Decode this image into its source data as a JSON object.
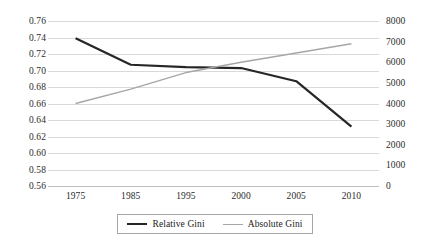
{
  "chart_data": {
    "type": "line",
    "title": "",
    "xlabel": "",
    "ylabel": "",
    "categories": [
      "1975",
      "1985",
      "1995",
      "2000",
      "2005",
      "2010"
    ],
    "grid": true,
    "legend_position": "bottom",
    "axes": {
      "left": {
        "label": "",
        "ylim": [
          0.56,
          0.76
        ],
        "tick_step": 0.02,
        "ticks": [
          "0.76",
          "0.74",
          "0.72",
          "0.70",
          "0.68",
          "0.66",
          "0.64",
          "0.62",
          "0.60",
          "0.58",
          "0.56"
        ],
        "tick_values": [
          0.76,
          0.74,
          0.72,
          0.7,
          0.68,
          0.66,
          0.64,
          0.62,
          0.6,
          0.58,
          0.56
        ]
      },
      "right": {
        "label": "",
        "ylim": [
          0,
          8000
        ],
        "tick_step": 1000,
        "ticks": [
          "8000",
          "7000",
          "6000",
          "5000",
          "4000",
          "3000",
          "2000",
          "1000",
          "0"
        ],
        "tick_values": [
          8000,
          7000,
          6000,
          5000,
          4000,
          3000,
          2000,
          1000,
          0
        ]
      }
    },
    "series": [
      {
        "name": "Relative Gini",
        "axis": "left",
        "color": "#262626",
        "width": 2.2,
        "values": [
          0.739,
          0.707,
          0.704,
          0.703,
          0.687,
          0.632
        ]
      },
      {
        "name": "Absolute Gini",
        "axis": "right",
        "color": "#a6a6a6",
        "width": 1.4,
        "values": [
          4000,
          4700,
          5500,
          6000,
          6450,
          6900
        ]
      }
    ]
  },
  "legend": {
    "entries": [
      {
        "label": "Relative Gini",
        "color": "#262626",
        "width": 2.2
      },
      {
        "label": "Absolute Gini",
        "color": "#a6a6a6",
        "width": 1.4
      }
    ]
  },
  "colors": {
    "relative_gini": "#262626",
    "absolute_gini": "#a6a6a6",
    "gridline": "#d9d9d9",
    "axis": "#bfbfbf",
    "background": "#ffffff"
  }
}
